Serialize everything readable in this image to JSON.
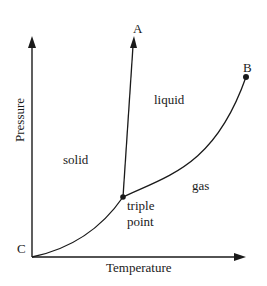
{
  "diagram": {
    "type": "phase-diagram",
    "axes": {
      "y_label": "Pressure",
      "x_label": "Temperature",
      "origin_label": "C"
    },
    "regions": {
      "solid": "solid",
      "liquid": "liquid",
      "gas": "gas"
    },
    "points": {
      "A": "A",
      "B": "B",
      "triple_point_line1": "triple",
      "triple_point_line2": "point"
    },
    "colors": {
      "ink": "#1a1a1a",
      "background": "#ffffff"
    }
  }
}
